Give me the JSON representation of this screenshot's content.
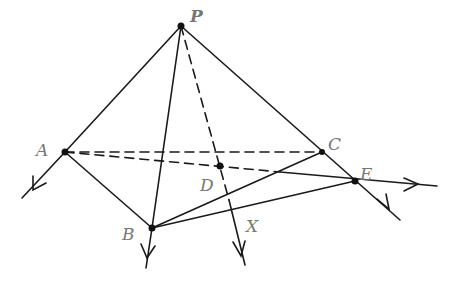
{
  "diagram": {
    "type": "3d-pyramid-geometry",
    "stroke_color": "#1a1a1a",
    "label_color": "#777777",
    "points": {
      "P": {
        "label": "P",
        "x": 181,
        "y": 26,
        "lx": 190,
        "ly": 22
      },
      "A": {
        "label": "A",
        "x": 65,
        "y": 152,
        "lx": 36,
        "ly": 156
      },
      "B": {
        "label": "B",
        "x": 152,
        "y": 228,
        "lx": 122,
        "ly": 240
      },
      "C": {
        "label": "C",
        "x": 322,
        "y": 152,
        "lx": 328,
        "ly": 150
      },
      "D": {
        "label": "D",
        "x": 220,
        "y": 166,
        "lx": 200,
        "ly": 191
      },
      "E": {
        "label": "E",
        "x": 355,
        "y": 181,
        "lx": 360,
        "ly": 180
      },
      "X": {
        "label": "X",
        "x": 245,
        "y": 265,
        "lx": 246,
        "ly": 232
      }
    },
    "labels": {
      "P": "P",
      "A": "A",
      "B": "B",
      "C": "C",
      "D": "D",
      "E": "E",
      "X": "X"
    }
  }
}
